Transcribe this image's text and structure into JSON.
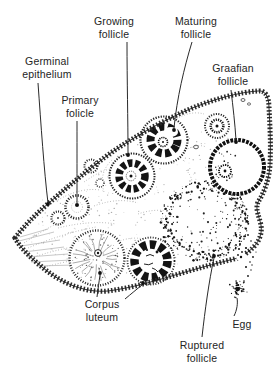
{
  "labels": {
    "germinal": {
      "text": "Germinal\nepithelium"
    },
    "primary": {
      "text": "Primary\nfolicle"
    },
    "growing": {
      "text": "Growing\nfollicle"
    },
    "maturing": {
      "text": "Maturing\nfollicle"
    },
    "graafian": {
      "text": "Graafian\nfollicle"
    },
    "corpus": {
      "text": "Corpus\nluteum"
    },
    "ruptured": {
      "text": "Ruptured\nfollicle"
    },
    "egg": {
      "text": "Egg"
    }
  },
  "colors": {
    "ink": "#242424",
    "paper": "#ffffff",
    "stroma": "#8c8c8c"
  }
}
